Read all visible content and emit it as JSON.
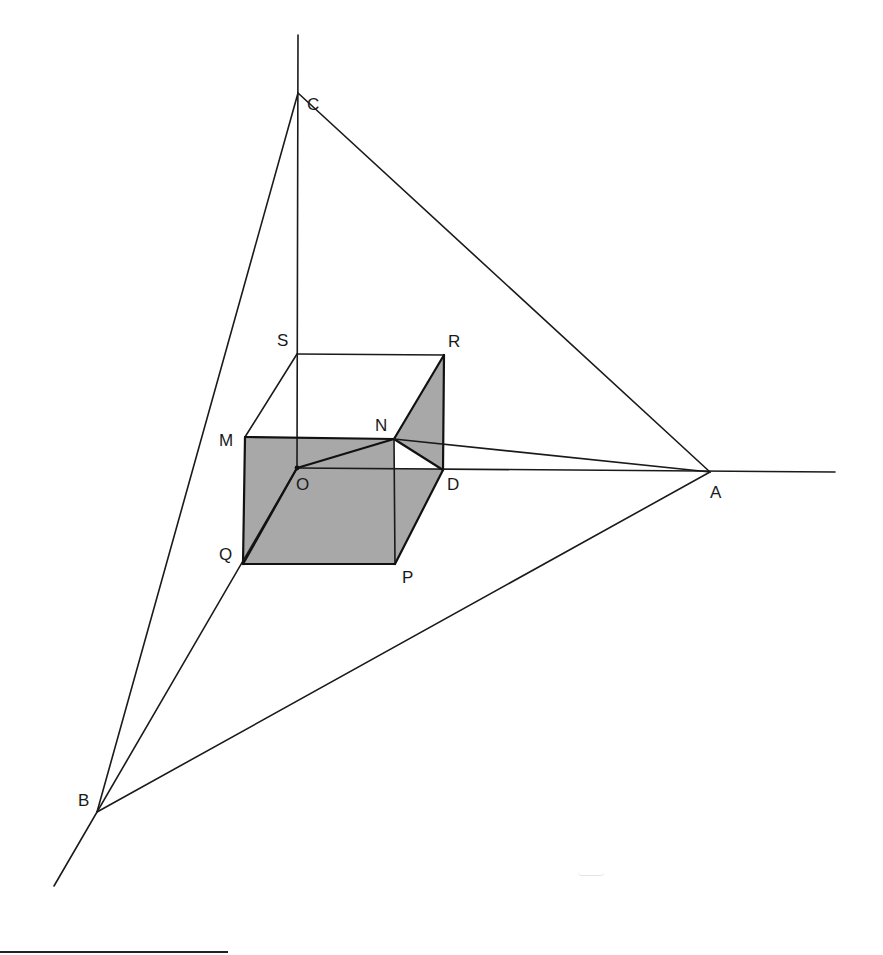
{
  "figure": {
    "colors": {
      "line": "#1a1a1a",
      "shaded_face": "#a8a8a8",
      "background": "#ffffff"
    },
    "vertices": {
      "C": {
        "label": "C",
        "x": 298,
        "y": 93
      },
      "A": {
        "label": "A",
        "x": 710,
        "y": 472
      },
      "B": {
        "label": "B",
        "x": 97,
        "y": 812
      },
      "O": {
        "label": "O",
        "x": 297,
        "y": 468
      },
      "S": {
        "label": "S",
        "x": 297,
        "y": 354
      },
      "R": {
        "label": "R",
        "x": 444,
        "y": 355
      },
      "M": {
        "label": "M",
        "x": 245,
        "y": 437
      },
      "N": {
        "label": "N",
        "x": 394,
        "y": 439
      },
      "D": {
        "label": "D",
        "x": 443,
        "y": 470
      },
      "Q": {
        "label": "Q",
        "x": 243,
        "y": 564
      },
      "P": {
        "label": "P",
        "x": 395,
        "y": 564
      }
    },
    "axis_extents": {
      "vertical_top": {
        "x": 298,
        "y": 35
      },
      "horizontal_right": {
        "x": 835,
        "y": 472
      },
      "diagonal_bottom": {
        "x": 54,
        "y": 886
      }
    },
    "triangle": [
      "A",
      "B",
      "C"
    ],
    "shaded_faces": [
      [
        "M",
        "N",
        "P",
        "Q"
      ],
      [
        "O",
        "D",
        "P",
        "Q"
      ],
      [
        "N",
        "R",
        "D"
      ]
    ],
    "edges": [
      [
        "S",
        "R"
      ],
      [
        "S",
        "M"
      ],
      [
        "R",
        "N"
      ],
      [
        "R",
        "D"
      ],
      [
        "M",
        "N"
      ],
      [
        "M",
        "Q"
      ],
      [
        "Q",
        "P"
      ],
      [
        "N",
        "P"
      ],
      [
        "P",
        "D"
      ],
      [
        "O",
        "D"
      ],
      [
        "O",
        "Q"
      ],
      [
        "N",
        "O"
      ],
      [
        "N",
        "D"
      ],
      [
        "N",
        "A"
      ]
    ],
    "footnote_rule": {
      "x1": 0,
      "x2": 228,
      "y": 952
    }
  }
}
